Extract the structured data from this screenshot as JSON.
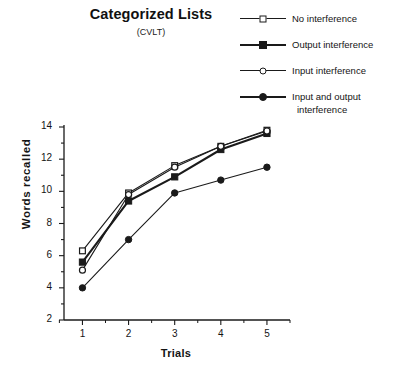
{
  "chart_data": {
    "type": "line",
    "title": "Categorized Lists",
    "subtitle": "(CVLT)",
    "xlabel": "Trials",
    "ylabel": "Words  recalled",
    "x": [
      1,
      2,
      3,
      4,
      5
    ],
    "categories": [
      "1",
      "2",
      "3",
      "4",
      "5"
    ],
    "xlim": [
      0.6,
      5.5
    ],
    "ylim": [
      2,
      14
    ],
    "xticks": [
      "1",
      "2",
      "3",
      "4",
      "5"
    ],
    "yticks": [
      "2",
      "4",
      "6",
      "8",
      "10",
      "12",
      "14"
    ],
    "minor_ticks": true,
    "grid": false,
    "legend_position": "top-right",
    "series": [
      {
        "name": "No interference",
        "marker": "open-square",
        "line": "thin",
        "values": [
          6.3,
          9.9,
          11.6,
          12.8,
          13.8
        ]
      },
      {
        "name": "Output interference",
        "marker": "filled-square",
        "line": "thick",
        "values": [
          5.6,
          9.4,
          10.9,
          12.6,
          13.6
        ]
      },
      {
        "name": "Input interference",
        "marker": "open-circle",
        "line": "thin",
        "values": [
          5.1,
          9.8,
          11.5,
          12.8,
          13.75
        ]
      },
      {
        "name": "Input and output interference",
        "marker": "filled-circle",
        "line": "thin",
        "values": [
          4.0,
          7.0,
          9.9,
          10.7,
          11.5
        ]
      }
    ],
    "colors": {
      "ink": "#1a1a1a",
      "background": "#ffffff"
    }
  },
  "legend": {
    "entries": [
      {
        "label": "No interference",
        "label2": ""
      },
      {
        "label": "Output interference",
        "label2": ""
      },
      {
        "label": "Input interference",
        "label2": ""
      },
      {
        "label": "Input and output",
        "label2": "interference"
      }
    ]
  }
}
